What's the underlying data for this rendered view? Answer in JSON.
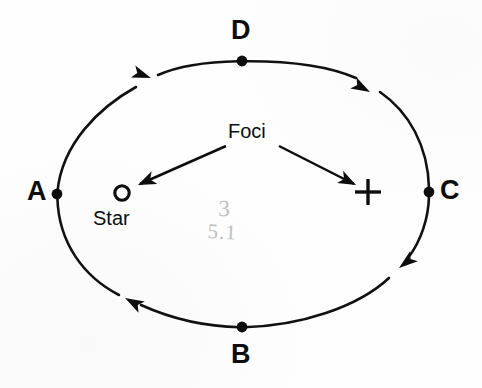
{
  "diagram": {
    "background_color": "#fefefe",
    "ink_color": "#0d0d0d",
    "pencil_color": "#a9a9a9",
    "orbit": {
      "center_x": 243,
      "center_y": 194,
      "radius_x": 186,
      "radius_y": 133,
      "direction": "A to B to C to D",
      "stroke_width": 2.6
    },
    "vertices": [
      {
        "label": "A",
        "point_x": 57,
        "point_y": 194,
        "label_x": 27,
        "label_y": 180
      },
      {
        "label": "B",
        "point_x": 242,
        "point_y": 327,
        "label_x": 232,
        "label_y": 342
      },
      {
        "label": "C",
        "point_x": 429,
        "point_y": 192,
        "label_x": 440,
        "label_y": 178
      },
      {
        "label": "D",
        "point_x": 242,
        "point_y": 61,
        "label_x": 232,
        "label_y": 18
      }
    ],
    "foci": {
      "caption": "Foci",
      "caption_x": 228,
      "caption_y": 122,
      "star": {
        "marker": "o",
        "label": "Star",
        "x": 122,
        "y": 193,
        "label_x": 93,
        "label_y": 209
      },
      "empty": {
        "marker": "+",
        "x": 368,
        "y": 192
      }
    },
    "annotation": {
      "type": "handwritten-pencil",
      "numerator": "3",
      "denominator": "5.1",
      "x": 209,
      "y": 198
    },
    "arrows": [
      {
        "name": "orbit-arrow-top-left",
        "tip_x": 144,
        "tip_y": 80,
        "angle_deg": 203
      },
      {
        "name": "orbit-arrow-top-right",
        "tip_x": 364,
        "tip_y": 86,
        "angle_deg": 215
      },
      {
        "name": "orbit-arrow-bottom-left",
        "tip_x": 130,
        "tip_y": 300,
        "angle_deg": 35
      },
      {
        "name": "orbit-arrow-bottom-right",
        "tip_x": 399,
        "tip_y": 266,
        "angle_deg": 320
      }
    ]
  }
}
